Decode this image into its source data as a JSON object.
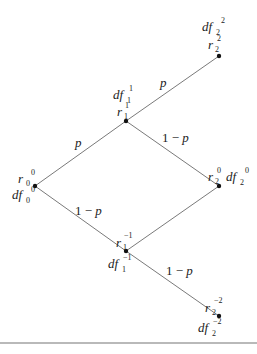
{
  "diagram": {
    "type": "binomial-tree",
    "header_faint_text": "",
    "nodes": [
      {
        "id": "n00",
        "x": 35,
        "y": 186,
        "r": "r",
        "r_sub": "0",
        "r_sup": "0",
        "df": "df",
        "df_sub": "0",
        "df_sup": "0"
      },
      {
        "id": "n11",
        "x": 126,
        "y": 121,
        "r": "r",
        "r_sub": "1",
        "r_sup": "1",
        "df": "df",
        "df_sub": "1",
        "df_sup": "1"
      },
      {
        "id": "n1m1",
        "x": 126,
        "y": 251,
        "r": "r",
        "r_sub": "1",
        "r_sup": "−1",
        "df": "df",
        "df_sub": "1",
        "df_sup": "−1"
      },
      {
        "id": "n22",
        "x": 219,
        "y": 56,
        "r": "r",
        "r_sub": "2",
        "r_sup": "2",
        "df": "df",
        "df_sub": "2",
        "df_sup": "2"
      },
      {
        "id": "n20",
        "x": 219,
        "y": 186,
        "r": "r",
        "r_sub": "2",
        "r_sup": "0",
        "df": "df",
        "df_sub": "2",
        "df_sup": "0"
      },
      {
        "id": "n2m2",
        "x": 219,
        "y": 316,
        "r": "r",
        "r_sub": "2",
        "r_sup": "−2",
        "df": "df",
        "df_sub": "2",
        "df_sup": "−2"
      }
    ],
    "edges": [
      {
        "from": "n00",
        "to": "n11",
        "label": "p"
      },
      {
        "from": "n00",
        "to": "n1m1",
        "label": "1 − p"
      },
      {
        "from": "n11",
        "to": "n22",
        "label": "p"
      },
      {
        "from": "n11",
        "to": "n20",
        "label": "1 − p"
      },
      {
        "from": "n1m1",
        "to": "n20",
        "label": ""
      },
      {
        "from": "n1m1",
        "to": "n2m2",
        "label": "1 − p"
      }
    ],
    "edge_labels": {
      "up_0": "p",
      "down_0_one": "1",
      "down_0_minus": "−",
      "down_0_p": "p",
      "up_1": "p",
      "down_1_one": "1",
      "down_1_minus": "−",
      "down_1_p": "p",
      "down_2_one": "1",
      "down_2_minus": "−",
      "down_2_p": "p"
    },
    "labels": {
      "r": "r",
      "df": "df",
      "sub0": "0",
      "sub1": "1",
      "sub2": "2",
      "sup0": "0",
      "sup1": "1",
      "sup2": "2",
      "supm1": "−1",
      "supm2": "−2"
    },
    "colors": {
      "line": "#7a7a7a",
      "node": "#111111",
      "text": "#222222",
      "rule": "#b9b9b9"
    }
  }
}
